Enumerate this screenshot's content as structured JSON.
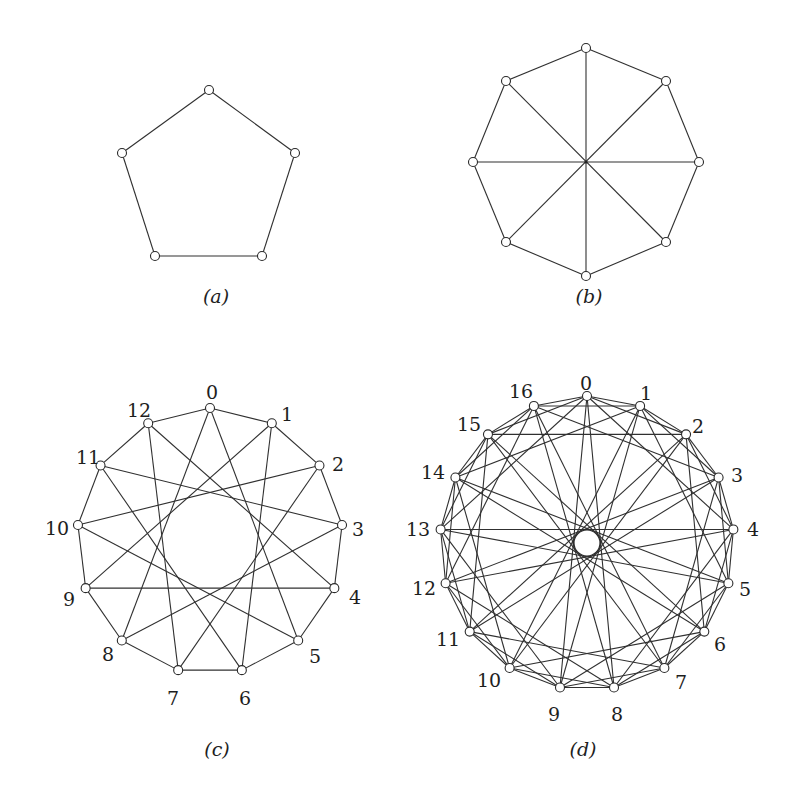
{
  "figure": {
    "panels": [
      {
        "id": "a",
        "caption": "(a)",
        "caption_pos": [
          216,
          303
        ],
        "description": "5-cycle (pentagon)",
        "nodes": [
          {
            "id": 0,
            "x": 209,
            "y": 90
          },
          {
            "id": 1,
            "x": 295,
            "y": 153
          },
          {
            "id": 2,
            "x": 262,
            "y": 256
          },
          {
            "id": 3,
            "x": 155,
            "y": 256
          },
          {
            "id": 4,
            "x": 122,
            "y": 153
          }
        ],
        "edges": [
          [
            0,
            1
          ],
          [
            1,
            2
          ],
          [
            2,
            3
          ],
          [
            3,
            4
          ],
          [
            4,
            0
          ]
        ],
        "labels": []
      },
      {
        "id": "b",
        "caption": "(b)",
        "caption_pos": [
          589,
          303
        ],
        "description": "8-cycle with 4 diametric chords (Wagner graph)",
        "center": [
          586,
          162
        ],
        "nodes": [
          {
            "id": 0,
            "x": 586,
            "y": 48
          },
          {
            "id": 1,
            "x": 666,
            "y": 81
          },
          {
            "id": 2,
            "x": 699,
            "y": 162
          },
          {
            "id": 3,
            "x": 666,
            "y": 242
          },
          {
            "id": 4,
            "x": 586,
            "y": 276
          },
          {
            "id": 5,
            "x": 506,
            "y": 242
          },
          {
            "id": 6,
            "x": 473,
            "y": 162
          },
          {
            "id": 7,
            "x": 506,
            "y": 81
          }
        ],
        "edges": [
          [
            0,
            1
          ],
          [
            1,
            2
          ],
          [
            2,
            3
          ],
          [
            3,
            4
          ],
          [
            4,
            5
          ],
          [
            5,
            6
          ],
          [
            6,
            7
          ],
          [
            7,
            0
          ],
          [
            0,
            4
          ],
          [
            1,
            5
          ],
          [
            2,
            6
          ],
          [
            3,
            7
          ]
        ],
        "labels": []
      },
      {
        "id": "c",
        "caption": "(c)",
        "caption_pos": [
          217,
          756
        ],
        "description": "Circulant graph on 13 vertices, jumps 1 and 5",
        "circulant": {
          "n": 13,
          "jumps": [
            1,
            5
          ],
          "center": [
            210,
            541
          ],
          "radius": 133
        },
        "labels": [
          {
            "text": "0",
            "x": 212,
            "y": 394
          },
          {
            "text": "1",
            "x": 287,
            "y": 416
          },
          {
            "text": "2",
            "x": 338,
            "y": 466
          },
          {
            "text": "3",
            "x": 358,
            "y": 531
          },
          {
            "text": "4",
            "x": 355,
            "y": 599
          },
          {
            "text": "5",
            "x": 315,
            "y": 658
          },
          {
            "text": "6",
            "x": 245,
            "y": 700
          },
          {
            "text": "7",
            "x": 173,
            "y": 700
          },
          {
            "text": "8",
            "x": 108,
            "y": 656
          },
          {
            "text": "9",
            "x": 69,
            "y": 601
          },
          {
            "text": "10",
            "x": 57,
            "y": 530
          },
          {
            "text": "11",
            "x": 88,
            "y": 459
          },
          {
            "text": "12",
            "x": 139,
            "y": 412
          }
        ]
      },
      {
        "id": "d",
        "caption": "(d)",
        "caption_pos": [
          583,
          756
        ],
        "description": "Paley graph of order 17 (circulant, jumps 1, 2, 4, 8)",
        "circulant": {
          "n": 17,
          "jumps": [
            1,
            2,
            4,
            8
          ],
          "center": [
            587,
            543
          ],
          "radius": 147
        },
        "labels": [
          {
            "text": "0",
            "x": 586,
            "y": 385
          },
          {
            "text": "1",
            "x": 646,
            "y": 395
          },
          {
            "text": "2",
            "x": 698,
            "y": 428
          },
          {
            "text": "3",
            "x": 737,
            "y": 477
          },
          {
            "text": "4",
            "x": 753,
            "y": 531
          },
          {
            "text": "5",
            "x": 745,
            "y": 591
          },
          {
            "text": "6",
            "x": 720,
            "y": 646
          },
          {
            "text": "7",
            "x": 681,
            "y": 684
          },
          {
            "text": "8",
            "x": 617,
            "y": 716
          },
          {
            "text": "9",
            "x": 554,
            "y": 716
          },
          {
            "text": "10",
            "x": 489,
            "y": 682
          },
          {
            "text": "11",
            "x": 448,
            "y": 641
          },
          {
            "text": "12",
            "x": 424,
            "y": 590
          },
          {
            "text": "13",
            "x": 418,
            "y": 531
          },
          {
            "text": "14",
            "x": 433,
            "y": 474
          },
          {
            "text": "15",
            "x": 469,
            "y": 426
          },
          {
            "text": "16",
            "x": 521,
            "y": 393
          }
        ],
        "hub_circle": {
          "x": 587,
          "y": 543,
          "r": 13
        }
      }
    ]
  }
}
